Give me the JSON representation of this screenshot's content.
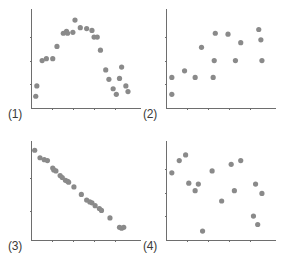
{
  "figure": {
    "background_color": "#ffffff",
    "point_color": "#8a8a8a",
    "axis_color": "#6e6e6e",
    "label_color": "#3a3a3a",
    "point_radius_px": 2.6
  },
  "chart_data": [
    {
      "type": "scatter",
      "title": "(1)",
      "panel_label": "(1)",
      "xlabel": "",
      "ylabel": "",
      "xlim": [
        0,
        10
      ],
      "ylim": [
        0,
        10
      ],
      "grid": false,
      "legend": "none",
      "xticks": [
        2,
        4,
        6,
        8
      ],
      "yticks": [
        2.5,
        5.0,
        7.5
      ],
      "description": "Inverted-U / curvilinear relationship",
      "x": [
        0.45,
        0.55,
        1.05,
        1.45,
        2.05,
        2.45,
        3.05,
        3.35,
        3.45,
        3.95,
        4.15,
        4.65,
        5.25,
        5.75,
        5.95,
        6.25,
        6.55,
        7.05,
        7.35,
        7.75,
        8.05,
        8.35,
        8.55,
        8.95,
        9.15
      ],
      "y": [
        1.25,
        2.35,
        5.05,
        5.25,
        5.25,
        6.55,
        7.95,
        8.15,
        7.95,
        8.05,
        9.35,
        8.55,
        8.45,
        8.25,
        7.55,
        7.55,
        6.15,
        4.05,
        3.05,
        2.05,
        1.45,
        3.15,
        4.35,
        2.35,
        1.75
      ],
      "n": 25
    },
    {
      "type": "scatter",
      "title": "(2)",
      "panel_label": "(2)",
      "xlabel": "",
      "ylabel": "",
      "xlim": [
        0,
        10
      ],
      "ylim": [
        0,
        10
      ],
      "grid": false,
      "legend": "none",
      "xticks": [
        2,
        4,
        6,
        8
      ],
      "yticks": [
        2.5,
        5.0,
        7.5
      ],
      "description": "Weak positive / scattered relationship",
      "x": [
        0.55,
        0.55,
        1.75,
        2.75,
        3.35,
        4.45,
        4.55,
        4.65,
        5.85,
        6.55,
        7.05,
        8.75,
        8.95,
        9.05
      ],
      "y": [
        1.45,
        3.25,
        3.95,
        3.25,
        6.45,
        3.25,
        5.05,
        7.95,
        7.85,
        5.05,
        6.95,
        8.35,
        7.25,
        5.05
      ],
      "n": 14
    },
    {
      "type": "scatter",
      "title": "(3)",
      "panel_label": "(3)",
      "xlabel": "",
      "ylabel": "",
      "xlim": [
        0,
        10
      ],
      "ylim": [
        0,
        10
      ],
      "grid": false,
      "legend": "none",
      "xticks": [
        2,
        4,
        6,
        8
      ],
      "yticks": [
        3.0,
        6.5
      ],
      "description": "Strong negative linear relationship",
      "x": [
        0.35,
        0.85,
        1.25,
        1.55,
        2.05,
        2.15,
        2.35,
        2.75,
        2.95,
        3.25,
        3.45,
        3.55,
        4.05,
        4.75,
        5.25,
        5.55,
        5.75,
        6.05,
        6.45,
        6.65,
        7.45,
        8.35,
        8.55,
        8.75
      ],
      "y": [
        9.55,
        8.75,
        8.55,
        8.45,
        7.65,
        7.45,
        7.35,
        6.85,
        6.65,
        6.35,
        6.25,
        6.15,
        5.65,
        4.85,
        4.25,
        4.05,
        3.95,
        3.65,
        3.35,
        3.15,
        2.35,
        1.35,
        1.25,
        1.35
      ],
      "n": 24
    },
    {
      "type": "scatter",
      "title": "(4)",
      "panel_label": "(4)",
      "xlabel": "",
      "ylabel": "",
      "xlim": [
        0,
        10
      ],
      "ylim": [
        0,
        10
      ],
      "grid": false,
      "legend": "none",
      "xticks": [
        2,
        4,
        6,
        8
      ],
      "yticks": [
        2.5,
        5.0,
        7.5
      ],
      "description": "No relationship / random scatter",
      "x": [
        0.55,
        1.25,
        1.85,
        2.15,
        2.75,
        3.05,
        3.45,
        4.35,
        5.25,
        6.15,
        6.45,
        7.05,
        8.25,
        8.45,
        8.65,
        9.05
      ],
      "y": [
        7.15,
        8.45,
        9.05,
        6.05,
        5.25,
        5.95,
        0.95,
        7.35,
        4.15,
        8.05,
        5.25,
        8.45,
        2.55,
        5.95,
        1.65,
        4.95
      ],
      "n": 16
    }
  ],
  "panels": [
    {
      "name": "panel-1",
      "label": "(1)",
      "left": 30,
      "top": 8,
      "width": 110,
      "height": 100,
      "label_left": 8,
      "label_top": 108
    },
    {
      "name": "panel-2",
      "label": "(2)",
      "left": 165,
      "top": 8,
      "width": 110,
      "height": 100,
      "label_left": 143,
      "label_top": 108
    },
    {
      "name": "panel-3",
      "label": "(3)",
      "left": 30,
      "top": 140,
      "width": 110,
      "height": 100,
      "label_left": 8,
      "label_top": 240,
      "yticks": [
        3.0,
        6.5
      ]
    },
    {
      "name": "panel-4",
      "label": "(4)",
      "left": 165,
      "top": 140,
      "width": 110,
      "height": 100,
      "label_left": 143,
      "label_top": 240
    }
  ]
}
